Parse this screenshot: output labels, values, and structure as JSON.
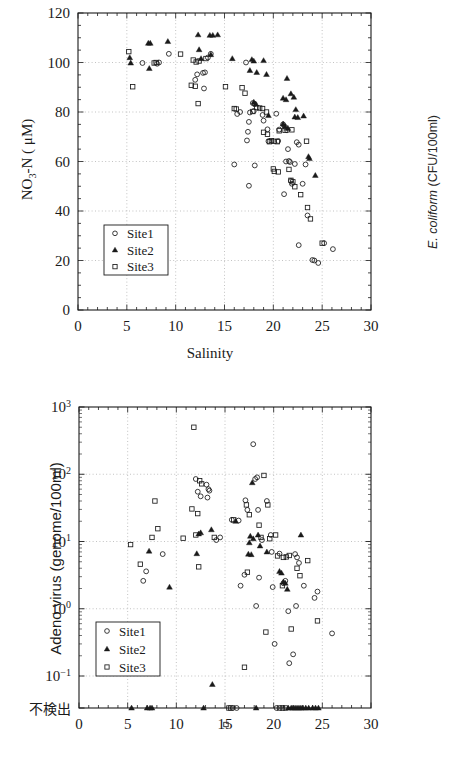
{
  "figure": {
    "background": "#ffffff",
    "marker_color": "#1a1a1a",
    "grid_color": "#9a9a9a",
    "axis_color": "#1a1a1a"
  },
  "right_axis_label": {
    "italic_part": "E. coliform",
    "rest": " (CFU/100ml)",
    "full": "E. coliform (CFU/100ml)"
  },
  "legend": {
    "entries": [
      {
        "label": "Site1",
        "marker": "open-circle"
      },
      {
        "label": "Site2",
        "marker": "filled-triangle"
      },
      {
        "label": "Site3",
        "marker": "open-square"
      }
    ]
  },
  "chart_data": [
    {
      "id": "no3n-vs-salinity",
      "type": "scatter",
      "title": "",
      "xlabel": "Salinity",
      "ylabel": "NO3-N ( μ M)",
      "ylabel_parts": {
        "pre": "NO",
        "sub": "3",
        "post": "-N ( μM)"
      },
      "xlim": [
        0,
        30
      ],
      "ylim": [
        0,
        120
      ],
      "xticks": [
        0,
        5,
        10,
        15,
        20,
        25,
        30
      ],
      "yticks": [
        0,
        20,
        40,
        60,
        80,
        100,
        120
      ],
      "x_minor_step": 1,
      "y_minor_step": 5,
      "grid": true,
      "grid_style": "dotted",
      "legend_position": "lower-left",
      "series": [
        {
          "name": "Site1",
          "marker": "open-circle",
          "points": [
            [
              6.6,
              99.8
            ],
            [
              8.1,
              99.5
            ],
            [
              8.3,
              100.0
            ],
            [
              9.3,
              103.5
            ],
            [
              12.2,
              95.2
            ],
            [
              12.0,
              93.0
            ],
            [
              12.8,
              95.8
            ],
            [
              13.0,
              96.0
            ],
            [
              12.9,
              89.5
            ],
            [
              13.6,
              103.5
            ],
            [
              13.3,
              102.0
            ],
            [
              16.3,
              79.2
            ],
            [
              16.6,
              80.0
            ],
            [
              17.2,
              100.0
            ],
            [
              17.9,
              83.6
            ],
            [
              18.1,
              83.2
            ],
            [
              17.6,
              79.8
            ],
            [
              18.0,
              80.4
            ],
            [
              17.5,
              76.0
            ],
            [
              17.4,
              72.0
            ],
            [
              17.3,
              68.5
            ],
            [
              18.9,
              78.8
            ],
            [
              19.0,
              76.5
            ],
            [
              19.4,
              73.0
            ],
            [
              19.5,
              68.2
            ],
            [
              20.3,
              79.3
            ],
            [
              20.6,
              72.9
            ],
            [
              20.5,
              68.3
            ],
            [
              16.0,
              58.8
            ],
            [
              18.1,
              58.4
            ],
            [
              17.5,
              50.2
            ],
            [
              21.0,
              75.0
            ],
            [
              21.2,
              74.0
            ],
            [
              21.4,
              72.6
            ],
            [
              21.6,
              60.2
            ],
            [
              21.7,
              59.8
            ],
            [
              21.3,
              60.0
            ],
            [
              21.5,
              65.0
            ],
            [
              21.8,
              52.2
            ],
            [
              21.9,
              51.0
            ],
            [
              21.1,
              46.8
            ],
            [
              22.4,
              67.8
            ],
            [
              22.6,
              66.8
            ],
            [
              22.2,
              59.0
            ],
            [
              23.3,
              58.8
            ],
            [
              23.0,
              51.0
            ],
            [
              23.5,
              38.2
            ],
            [
              22.6,
              26.2
            ],
            [
              24.0,
              20.2
            ],
            [
              24.2,
              20.0
            ],
            [
              24.6,
              19.0
            ],
            [
              25.2,
              27.0
            ],
            [
              26.1,
              24.6
            ]
          ]
        },
        {
          "name": "Site2",
          "marker": "filled-triangle",
          "points": [
            [
              5.3,
              102.0
            ],
            [
              5.4,
              99.8
            ],
            [
              7.2,
              107.8
            ],
            [
              7.4,
              107.8
            ],
            [
              7.3,
              97.6
            ],
            [
              9.2,
              108.5
            ],
            [
              12.3,
              111.2
            ],
            [
              12.4,
              105.2
            ],
            [
              12.6,
              101.6
            ],
            [
              13.5,
              111.0
            ],
            [
              13.8,
              111.0
            ],
            [
              14.3,
              111.2
            ],
            [
              13.6,
              103.2
            ],
            [
              15.8,
              101.6
            ],
            [
              17.8,
              101.2
            ],
            [
              18.0,
              100.6
            ],
            [
              17.6,
              96.8
            ],
            [
              18.3,
              96.0
            ],
            [
              19.0,
              100.8
            ],
            [
              19.3,
              95.2
            ],
            [
              18.0,
              84.0
            ],
            [
              18.2,
              83.2
            ],
            [
              19.5,
              78.6
            ],
            [
              21.4,
              93.6
            ],
            [
              21.0,
              85.6
            ],
            [
              21.3,
              85.0
            ],
            [
              21.8,
              87.4
            ],
            [
              22.1,
              86.0
            ],
            [
              22.3,
              81.0
            ],
            [
              21.0,
              75.2
            ],
            [
              21.2,
              74.2
            ],
            [
              21.5,
              73.4
            ],
            [
              22.2,
              78.0
            ],
            [
              22.5,
              77.8
            ],
            [
              23.1,
              78.4
            ],
            [
              23.6,
              62.0
            ],
            [
              23.7,
              61.2
            ],
            [
              24.3,
              54.4
            ]
          ]
        },
        {
          "name": "Site3",
          "marker": "open-square",
          "points": [
            [
              5.2,
              104.4
            ],
            [
              5.6,
              90.2
            ],
            [
              7.8,
              99.8
            ],
            [
              8.0,
              100.0
            ],
            [
              10.5,
              103.4
            ],
            [
              11.8,
              101.0
            ],
            [
              12.1,
              100.2
            ],
            [
              12.4,
              100.6
            ],
            [
              13.1,
              101.6
            ],
            [
              11.6,
              90.8
            ],
            [
              12.0,
              90.4
            ],
            [
              12.3,
              83.4
            ],
            [
              15.1,
              90.2
            ],
            [
              16.0,
              81.4
            ],
            [
              16.2,
              81.2
            ],
            [
              16.8,
              89.8
            ],
            [
              17.1,
              87.6
            ],
            [
              17.9,
              80.2
            ],
            [
              18.3,
              81.8
            ],
            [
              18.6,
              81.6
            ],
            [
              18.9,
              81.4
            ],
            [
              19.3,
              80.0
            ],
            [
              19.0,
              71.8
            ],
            [
              19.4,
              71.0
            ],
            [
              19.6,
              68.0
            ],
            [
              19.8,
              68.4
            ],
            [
              20.1,
              68.2
            ],
            [
              20.4,
              68.0
            ],
            [
              20.6,
              72.4
            ],
            [
              20.0,
              57.0
            ],
            [
              20.1,
              56.0
            ],
            [
              20.5,
              55.8
            ],
            [
              21.2,
              72.6
            ],
            [
              21.9,
              72.8
            ],
            [
              21.6,
              56.8
            ],
            [
              21.8,
              52.4
            ],
            [
              22.0,
              51.8
            ],
            [
              22.2,
              49.8
            ],
            [
              22.8,
              46.6
            ],
            [
              23.4,
              68.2
            ],
            [
              23.5,
              41.4
            ],
            [
              23.8,
              36.8
            ],
            [
              25.0,
              27.0
            ]
          ]
        }
      ]
    },
    {
      "id": "adenovirus-vs-salinity",
      "type": "scatter",
      "title": "",
      "xlabel": "Salinity",
      "ylabel": "Adeno virus (genome/100ml)",
      "xlim": [
        0,
        30
      ],
      "xticks": [
        0,
        5,
        10,
        15,
        20,
        25,
        30
      ],
      "x_minor_step": 1,
      "yscale": "log",
      "ylim": [
        0.1,
        1000
      ],
      "yticks": [
        "10³",
        "10²",
        "10¹",
        "10⁰",
        "10⁻¹",
        "不検出"
      ],
      "ytick_values": [
        1000,
        100,
        10,
        1,
        0.1,
        null
      ],
      "below_detection_label": "不検出",
      "grid": true,
      "grid_style": "dotted",
      "legend_position": "lower-left",
      "series": [
        {
          "name": "Site1",
          "marker": "open-circle",
          "points": [
            [
              6.9,
              3.6
            ],
            [
              6.6,
              2.6
            ],
            [
              8.6,
              6.5
            ],
            [
              12.0,
              85.0
            ],
            [
              12.2,
              55.0
            ],
            [
              12.5,
              47.0
            ],
            [
              13.1,
              70.0
            ],
            [
              13.3,
              60.0
            ],
            [
              13.4,
              57.0
            ],
            [
              13.2,
              45.0
            ],
            [
              14.1,
              10.5
            ],
            [
              14.5,
              11.5
            ],
            [
              15.7,
              21.0
            ],
            [
              16.4,
              20.5
            ],
            [
              17.1,
              41.0
            ],
            [
              17.3,
              29.5
            ],
            [
              17.0,
              3.2
            ],
            [
              16.6,
              2.2
            ],
            [
              17.9,
              280.0
            ],
            [
              18.3,
              90.0
            ],
            [
              18.1,
              85.0
            ],
            [
              18.4,
              29.5
            ],
            [
              18.8,
              10.5
            ],
            [
              18.5,
              2.9
            ],
            [
              18.2,
              1.1
            ],
            [
              19.3,
              40.0
            ],
            [
              19.7,
              12.5
            ],
            [
              19.8,
              7.0
            ],
            [
              19.9,
              2.1
            ],
            [
              20.1,
              0.3
            ],
            [
              20.6,
              6.6
            ],
            [
              21.0,
              2.4
            ],
            [
              21.2,
              2.6
            ],
            [
              21.5,
              0.92
            ],
            [
              21.6,
              0.155
            ],
            [
              22.0,
              0.21
            ],
            [
              22.2,
              6.5
            ],
            [
              22.4,
              5.8
            ],
            [
              22.6,
              4.8
            ],
            [
              22.3,
              1.1
            ],
            [
              23.1,
              2.2
            ],
            [
              24.2,
              1.45
            ],
            [
              24.5,
              1.8
            ],
            [
              26.0,
              0.43
            ]
          ]
        },
        {
          "name": "Site2",
          "marker": "filled-triangle",
          "points": [
            [
              7.2,
              7.2
            ],
            [
              9.3,
              2.1
            ],
            [
              12.3,
              13.0
            ],
            [
              12.5,
              13.5
            ],
            [
              12.1,
              6.6
            ],
            [
              13.6,
              15.0
            ],
            [
              13.7,
              0.075
            ],
            [
              16.1,
              20.0
            ],
            [
              17.8,
              75.0
            ],
            [
              17.6,
              12.0
            ],
            [
              17.9,
              11.0
            ],
            [
              17.5,
              9.6
            ],
            [
              17.4,
              6.5
            ],
            [
              17.7,
              6.4
            ],
            [
              18.4,
              12.5
            ],
            [
              18.6,
              8.6
            ],
            [
              19.3,
              7.0
            ],
            [
              20.6,
              3.6
            ],
            [
              20.8,
              3.4
            ],
            [
              21.0,
              2.5
            ],
            [
              21.2,
              2.4
            ],
            [
              21.4,
              1.95
            ],
            [
              22.8,
              12.5
            ]
          ]
        },
        {
          "name": "Site3",
          "marker": "open-square",
          "points": [
            [
              5.3,
              9.0
            ],
            [
              6.3,
              4.6
            ],
            [
              7.8,
              40.0
            ],
            [
              7.5,
              11.5
            ],
            [
              8.1,
              15.5
            ],
            [
              10.7,
              11.2
            ],
            [
              11.6,
              30.5
            ],
            [
              11.8,
              500.0
            ],
            [
              12.2,
              26.0
            ],
            [
              12.4,
              80.0
            ],
            [
              12.6,
              72.0
            ],
            [
              12.3,
              4.2
            ],
            [
              12.0,
              12.5
            ],
            [
              13.9,
              11.5
            ],
            [
              15.1,
              0.019
            ],
            [
              15.9,
              21.0
            ],
            [
              17.0,
              0.135
            ],
            [
              17.2,
              35.0
            ],
            [
              17.5,
              25.0
            ],
            [
              17.3,
              3.5
            ],
            [
              18.5,
              17.5
            ],
            [
              18.7,
              11.5
            ],
            [
              19.0,
              96.0
            ],
            [
              19.4,
              35.0
            ],
            [
              19.6,
              11.0
            ],
            [
              19.2,
              0.45
            ],
            [
              20.2,
              12.5
            ],
            [
              20.4,
              6.1
            ],
            [
              20.9,
              2.2
            ],
            [
              21.3,
              5.9
            ],
            [
              21.0,
              5.8
            ],
            [
              21.6,
              6.2
            ],
            [
              21.8,
              0.5
            ],
            [
              22.4,
              4.0
            ],
            [
              22.7,
              3.1
            ],
            [
              23.5,
              5.2
            ],
            [
              24.5,
              0.66
            ]
          ]
        }
      ],
      "below_detection_points": {
        "Site1": [
          15.8,
          16.2,
          20.3
        ],
        "Site2": [
          5.4,
          7.0,
          7.3,
          7.5,
          12.8,
          18.2,
          21.5,
          21.8,
          22.0,
          22.2,
          22.4,
          22.6,
          22.8,
          23.0,
          23.3,
          23.6,
          24.0,
          24.3,
          24.6
        ],
        "Site3": [
          15.4,
          15.6,
          20.6,
          20.9,
          21.2
        ]
      }
    }
  ]
}
